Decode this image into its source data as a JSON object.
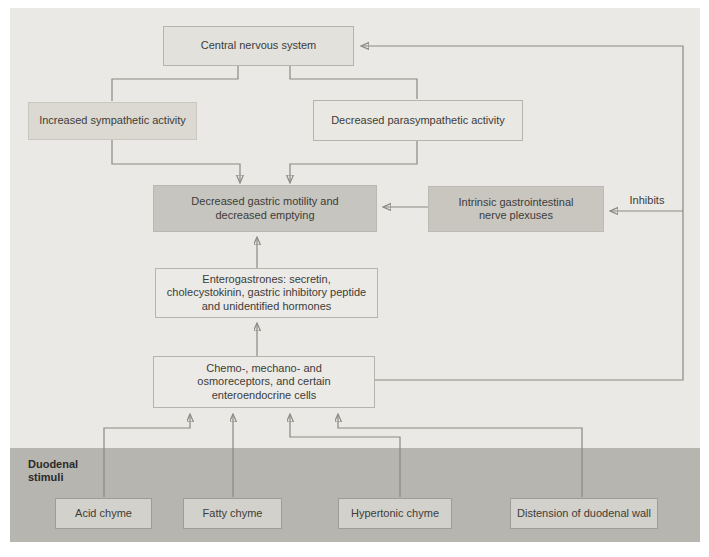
{
  "diagram": {
    "title_domain": "gastric emptying inhibition flowchart",
    "nodes": {
      "cns": {
        "label": "Central nervous system"
      },
      "sympathetic": {
        "label": "Increased sympathetic activity"
      },
      "parasympathetic": {
        "label": "Decreased parasympathetic activity"
      },
      "gastric_motility": {
        "label": "Decreased gastric motility and decreased emptying"
      },
      "intrinsic_plexuses": {
        "label": "Intrinsic gastrointestinal nerve plexuses"
      },
      "enterogastrones": {
        "label": "Enterogastrones: secretin, cholecystokinin, gastric inhibitory peptide and unidentified hormones"
      },
      "receptors": {
        "label": "Chemo-, mechano- and osmoreceptors, and certain enteroendocrine cells"
      },
      "acid_chyme": {
        "label": "Acid chyme"
      },
      "fatty_chyme": {
        "label": "Fatty chyme"
      },
      "hypertonic_chyme": {
        "label": "Hypertonic chyme"
      },
      "distension": {
        "label": "Distension of duodenal wall"
      }
    },
    "labels": {
      "inhibits": "Inhibits",
      "duodenal_stimuli": "Duodenal stimuli"
    },
    "colors": {
      "panel_background": "#eae9e5",
      "duodenal_band": "#b7b5af",
      "dark_node_fill": "#c7c5bf",
      "medium_node_fill": "#dbd9d2",
      "light_node_fill": "#ebeae6",
      "stimulus_node_fill": "#d3d1cb",
      "line_color": "#8b8983",
      "text_color": "#3d3c39"
    }
  }
}
